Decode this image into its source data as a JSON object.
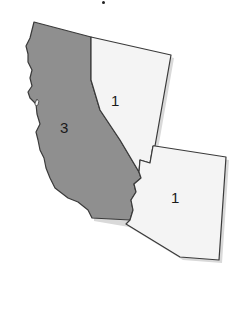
{
  "map": {
    "regions": [
      {
        "name": "California",
        "label": "3",
        "fill": "#8f8f8f"
      },
      {
        "name": "Nevada",
        "label": "1",
        "fill": "#f4f4f4"
      },
      {
        "name": "Arizona",
        "label": "1",
        "fill": "#f4f4f4"
      }
    ],
    "colors": {
      "stroke": "#3a3a3a",
      "shadow": "#d6d6d6",
      "shaded": "#8f8f8f",
      "unshaded": "#f4f4f4"
    }
  }
}
